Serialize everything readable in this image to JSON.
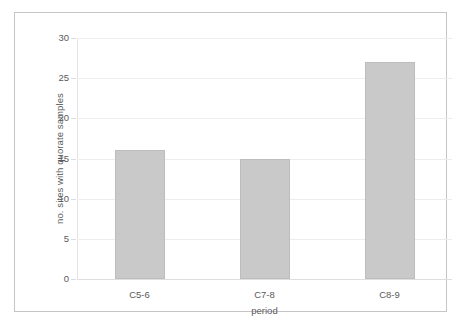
{
  "chart_data": {
    "type": "bar",
    "title": "",
    "subtitle": "",
    "xlabel": "period",
    "ylabel": "no. sites with quorate samples",
    "categories": [
      "C5-6",
      "C7-8",
      "C8-9"
    ],
    "values": [
      16,
      15,
      27
    ],
    "series": [
      {
        "name": "no. sites with quorate samples",
        "values": [
          16,
          15,
          27
        ]
      }
    ],
    "ylim": [
      0,
      30
    ],
    "ytick_labels": [
      "30",
      "25",
      "20",
      "15",
      "10",
      "5",
      "0"
    ],
    "ytick_values": [
      30,
      25,
      20,
      15,
      10,
      5,
      0
    ],
    "ystep": 5,
    "grid": true,
    "grid_axis": "y",
    "legend": false,
    "legend_position": "none",
    "annotations": [],
    "colors": {
      "bar_fill": "#c9c9c9",
      "bar_border": "#bdbdbd",
      "gridline": "#ededf0",
      "axis_line": "#dedee2",
      "text": "#5a5a5a",
      "frame": "#c5c5c9",
      "background": "#ffffff"
    }
  }
}
